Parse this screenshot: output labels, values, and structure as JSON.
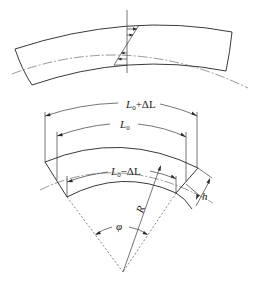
{
  "figure": {
    "colors": {
      "ink": "#3a3a3a",
      "background": "#ffffff"
    }
  },
  "top_view": {
    "name": "stress distribution across curved beam section",
    "labels": []
  },
  "bottom_view": {
    "labels": {
      "outer_length": {
        "base": "L",
        "sub": "0",
        "rest": "+ΔL"
      },
      "neutral_length": {
        "base": "L",
        "sub": "0",
        "rest": ""
      },
      "inner_length": {
        "base": "L",
        "sub": "0",
        "rest": "−ΔL"
      },
      "radius": "R",
      "angle": "φ",
      "thickness": "h"
    }
  }
}
